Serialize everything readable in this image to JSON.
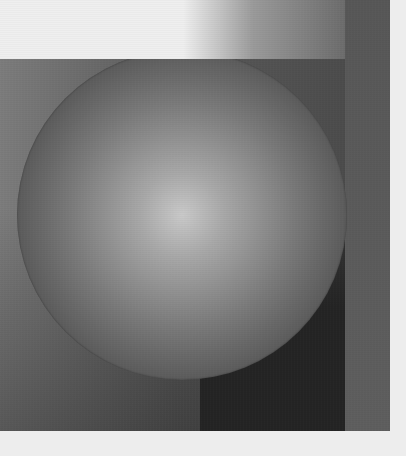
{
  "canvas": {
    "width": 406,
    "height": 456,
    "background": "#ededed"
  },
  "top_band": {
    "gradient_start_color": "#efefef",
    "gradient_mid_color": "#9a9a9a",
    "gradient_end_color": "#565656",
    "gradient_start_x_pct": 47,
    "gradient_end_x_pct": 100
  },
  "panel": {
    "left_color": "#7c7c7c",
    "mid_color": "#5a5a5a",
    "right_color": "#484848",
    "bottom_right_color": "#2c2c2c"
  },
  "right_strip": {
    "top_color": "#575757",
    "bottom_color": "#5e5e5e"
  },
  "shadow_column": {
    "color": "#242424"
  },
  "sphere": {
    "center_x": 182,
    "center_y": 215,
    "radius": 165,
    "highlight_color": "#c9c9c9",
    "mid_color": "#7a7a7a",
    "edge_color": "#383838",
    "highlight_x_pct": 50,
    "highlight_y_pct": 50
  }
}
